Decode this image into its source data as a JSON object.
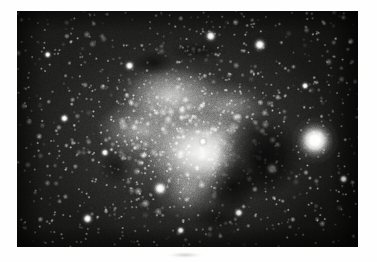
{
  "page": {
    "background_color": "#ffffff",
    "width": 377,
    "height": 262
  },
  "photo": {
    "subject": "North America Nebula (NGC 7000) emission nebula and surrounding Milky Way star field",
    "medium": "black-and-white astronomical photograph print",
    "frame": {
      "x": 17,
      "y": 11,
      "width": 341,
      "height": 236
    },
    "border_color": "#ffffff",
    "sky_color": "#131312",
    "nebula_color": "#f8f8f6",
    "dust_lane_color": "#060606",
    "caption": "",
    "features": [
      {
        "name": "nebula-core",
        "label": "bright nebula core"
      },
      {
        "name": "dust-lane-gulf",
        "label": "dark dust lane"
      },
      {
        "name": "bright-field-star",
        "label": "bright foreground star"
      },
      {
        "name": "star-field",
        "label": "dense Milky Way star field"
      }
    ]
  },
  "stars": {
    "bright": [
      {
        "cx": 0.874,
        "cy": 0.548,
        "r": 10.5
      },
      {
        "cx": 0.42,
        "cy": 0.752,
        "r": 4.2
      },
      {
        "cx": 0.748,
        "cy": 0.668,
        "r": 3.4
      },
      {
        "cx": 0.568,
        "cy": 0.106,
        "r": 3.2
      },
      {
        "cx": 0.712,
        "cy": 0.143,
        "r": 3.6
      },
      {
        "cx": 0.545,
        "cy": 0.553,
        "r": 2.4
      },
      {
        "cx": 0.207,
        "cy": 0.88,
        "r": 3.0
      },
      {
        "cx": 0.33,
        "cy": 0.232,
        "r": 2.8
      },
      {
        "cx": 0.65,
        "cy": 0.855,
        "r": 2.6
      },
      {
        "cx": 0.958,
        "cy": 0.712,
        "r": 2.4
      },
      {
        "cx": 0.139,
        "cy": 0.455,
        "r": 2.5
      },
      {
        "cx": 0.48,
        "cy": 0.93,
        "r": 2.3
      },
      {
        "cx": 0.845,
        "cy": 0.317,
        "r": 2.2
      },
      {
        "cx": 0.258,
        "cy": 0.6,
        "r": 2.4
      },
      {
        "cx": 0.09,
        "cy": 0.185,
        "r": 2.1
      }
    ],
    "field_count": 2400
  }
}
